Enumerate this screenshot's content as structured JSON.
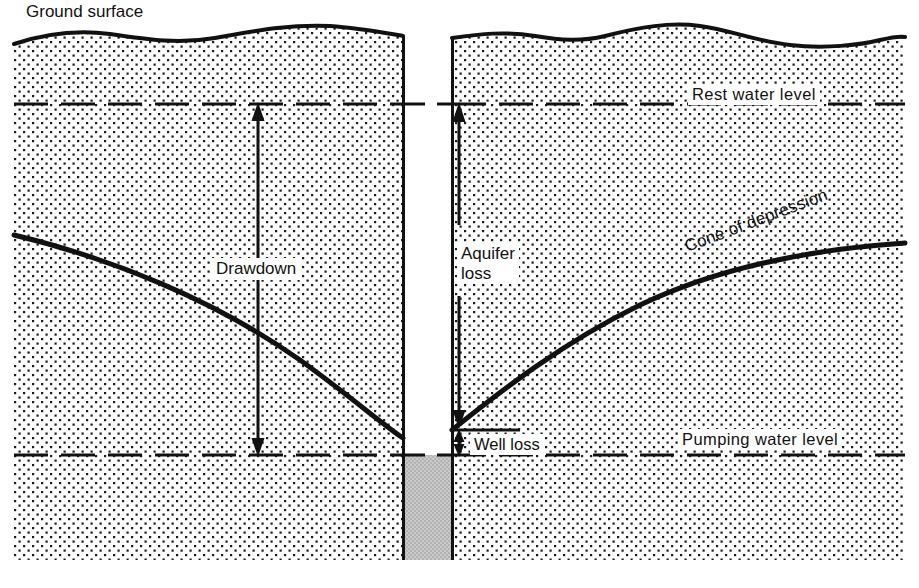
{
  "figure": {
    "title_semantic": "well-drawdown-cross-section",
    "background_color": "#ffffff",
    "line_color": "#111111",
    "stipple_color": "#1a1a1a",
    "well_water_color": "#c0c0c0",
    "width": 919,
    "height": 588
  },
  "labels": {
    "ground_surface": "Ground surface",
    "rest_water_level": "Rest water level",
    "pumping_water_level": "Pumping water level",
    "drawdown": "Drawdown",
    "aquifer_loss_line1": "Aquifer",
    "aquifer_loss_line2": "loss",
    "well_loss": "Well loss",
    "cone_of_depression": "Cone of depression"
  },
  "diagram_data": {
    "type": "cross-section-diagram",
    "subject": "Groundwater well drawdown components",
    "levels": [
      {
        "name": "ground surface",
        "style": "solid wavy line",
        "y_px": 36
      },
      {
        "name": "rest water level",
        "style": "dashed line",
        "y_px": 104
      },
      {
        "name": "pumping water level",
        "style": "dashed line",
        "y_px": 455
      }
    ],
    "well": {
      "left_px": 403,
      "right_px": 452,
      "casing_style": "solid vertical lines",
      "water_fill_top_px": 455,
      "water_fill_bottom_px": 560,
      "water_fill_color": "#c0c0c0"
    },
    "aquifer": {
      "fill": "stipple / dot pattern",
      "top_px": 36,
      "bottom_px": 560
    },
    "curves": [
      {
        "name": "cone of depression (left limb)",
        "from_px": [
          14,
          235
        ],
        "to_px": [
          403,
          438
        ]
      },
      {
        "name": "cone of depression (right limb)",
        "from_px": [
          452,
          430
        ],
        "to_px": [
          905,
          243
        ]
      }
    ],
    "measures": [
      {
        "name": "Drawdown",
        "arrow": "double-headed vertical",
        "x_px": 258,
        "from_y_px": 104,
        "to_y_px": 455,
        "meaning": "total fall from rest water level to pumping water level"
      },
      {
        "name": "Aquifer loss",
        "arrow": "double-headed vertical",
        "x_px": 459,
        "from_y_px": 104,
        "to_y_px": 430,
        "meaning": "head loss in the aquifer"
      },
      {
        "name": "Well loss",
        "arrow": "double-headed vertical",
        "x_px": 459,
        "from_y_px": 430,
        "to_y_px": 455,
        "meaning": "additional head loss entering the well"
      }
    ]
  }
}
